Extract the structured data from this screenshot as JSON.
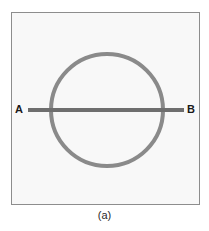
{
  "figure": {
    "caption": "(a)",
    "frame": {
      "background_color": "#f8f8f8",
      "border_color": "#8d8d8d"
    },
    "page_background_color": "#ffffff",
    "shapes": {
      "circle": {
        "name": "circle-outline",
        "center_x": 107,
        "center_y": 110,
        "radius": 56,
        "stroke_color": "#8a8a8a",
        "stroke_width": 4,
        "fill": "none"
      },
      "chord_line": {
        "name": "horizontal-diameter-line",
        "x1": 28,
        "y1": 110,
        "x2": 184,
        "y2": 110,
        "stroke_color": "#6e6e6e",
        "stroke_width": 4
      }
    },
    "labels": {
      "left_endpoint": "A",
      "right_endpoint": "B"
    }
  }
}
